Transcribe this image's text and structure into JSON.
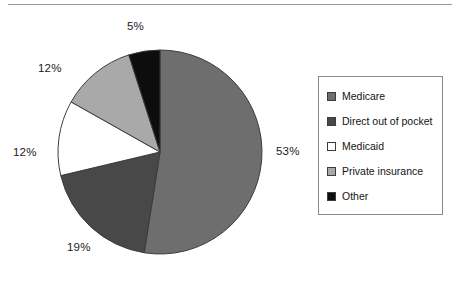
{
  "chart_data": {
    "type": "pie",
    "title": "",
    "subtitle": "",
    "categories": [
      "Medicare",
      "Direct out of pocket",
      "Medicaid",
      "Private insurance",
      "Other"
    ],
    "values": [
      53,
      19,
      12,
      12,
      5
    ],
    "unit": "%",
    "data_labels": [
      "53%",
      "19%",
      "12%",
      "12%",
      "5%"
    ],
    "colors": [
      "#6e6e6e",
      "#484848",
      "#ffffff",
      "#a9a9a9",
      "#0d0d0d"
    ],
    "legend_position": "right",
    "grid": false,
    "start_angle_deg": 0,
    "direction": "clockwise",
    "xlabel": "",
    "ylabel": ""
  },
  "figure": {
    "top_rule_color": "#9a9a9a",
    "background": "#ffffff"
  },
  "legend": {
    "border_color": "#8a8a8a",
    "items": [
      {
        "label": "Medicare",
        "color": "#6e6e6e"
      },
      {
        "label": "Direct out of pocket",
        "color": "#484848"
      },
      {
        "label": "Medicaid",
        "color": "#ffffff"
      },
      {
        "label": "Private insurance",
        "color": "#a9a9a9"
      },
      {
        "label": "Other",
        "color": "#0d0d0d"
      }
    ]
  },
  "pie": {
    "center_x": 160,
    "center_y": 152,
    "radius": 102,
    "outline_color": "#3c3c3c",
    "labels": [
      {
        "name": "medicare",
        "text": "53%"
      },
      {
        "name": "direct-out-of-pocket",
        "text": "19%"
      },
      {
        "name": "medicaid",
        "text": "12%"
      },
      {
        "name": "private-insurance",
        "text": "12%"
      },
      {
        "name": "other",
        "text": "5%"
      }
    ]
  }
}
